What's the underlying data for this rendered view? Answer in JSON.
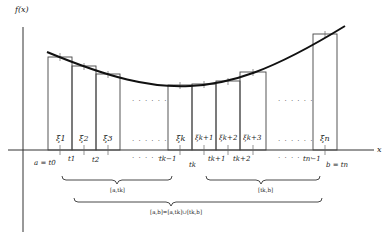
{
  "diagram": {
    "y_axis_label": "f(x)",
    "x_axis_label": "x",
    "xi_labels": [
      "ξ1",
      "ξ2",
      "ξ3",
      "ξk",
      "ξk+1",
      "ξk+2",
      "ξk+3",
      "ξn"
    ],
    "t_labels": [
      "a = t0",
      "t1",
      "t2",
      "tk−1",
      "tk",
      "tk+1",
      "tk+2",
      "tn−1",
      "b = tn"
    ],
    "ellipsis": "· · · · · ·",
    "braces": {
      "left": "[a,tk]",
      "right": "[tk,b]",
      "total": "[a,b]=[a,tk]∪[tk,b]"
    },
    "colors": {
      "line": "#222222",
      "curve": "#111111",
      "background": "#ffffff"
    }
  }
}
